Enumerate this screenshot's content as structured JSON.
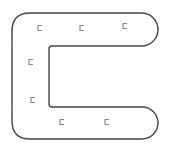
{
  "diagram": {
    "shape": "C-shaped corridor outline",
    "stroke_color": "#444444",
    "glyph_color": "#8a8a8a",
    "glyph_char": "⊏",
    "markers": [
      {
        "x": 38,
        "y": 28,
        "label": "⊏"
      },
      {
        "x": 80,
        "y": 28,
        "label": "⊏"
      },
      {
        "x": 123,
        "y": 26,
        "label": "⊏"
      },
      {
        "x": 29,
        "y": 62,
        "label": "⊏"
      },
      {
        "x": 31,
        "y": 100,
        "label": "⊏"
      },
      {
        "x": 60,
        "y": 122,
        "label": "⊏"
      },
      {
        "x": 105,
        "y": 122,
        "label": "⊏"
      }
    ]
  }
}
